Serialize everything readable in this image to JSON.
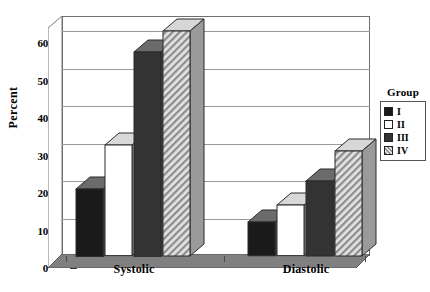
{
  "chart_data": {
    "type": "bar",
    "title": "",
    "xlabel": "",
    "ylabel": "Percent",
    "categories": [
      "Systolic",
      "Diastolic"
    ],
    "ylim": [
      0,
      64
    ],
    "yticks": [
      0,
      10,
      20,
      30,
      40,
      50,
      60
    ],
    "grid": true,
    "legend_position": "right",
    "legend_title": "Group",
    "series": [
      {
        "name": "I",
        "values": [
          18,
          9
        ],
        "fill": "#1a1a1a",
        "pattern": "solid-black"
      },
      {
        "name": "II",
        "values": [
          29.5,
          13.5
        ],
        "fill": "#ffffff",
        "pattern": "solid-white"
      },
      {
        "name": "III",
        "values": [
          54.5,
          20
        ],
        "fill": "#333333",
        "pattern": "solid-darkgray"
      },
      {
        "name": "IV",
        "values": [
          60,
          28
        ],
        "fill": "#c9c9c9",
        "pattern": "diagonal-hatch"
      }
    ]
  },
  "axis": {
    "y_tick_labels": [
      "60",
      "50",
      "40",
      "30",
      "20",
      "10",
      "0"
    ],
    "y_title": "Percent",
    "x_tick_labels": [
      "Systolic",
      "Diastolic"
    ]
  },
  "legend": {
    "title": "Group",
    "items": [
      {
        "label": "I",
        "swatch": "black-square-icon"
      },
      {
        "label": "II",
        "swatch": "white-square-icon"
      },
      {
        "label": "III",
        "swatch": "darkgray-square-icon"
      },
      {
        "label": "IV",
        "swatch": "hatched-square-icon"
      }
    ]
  }
}
